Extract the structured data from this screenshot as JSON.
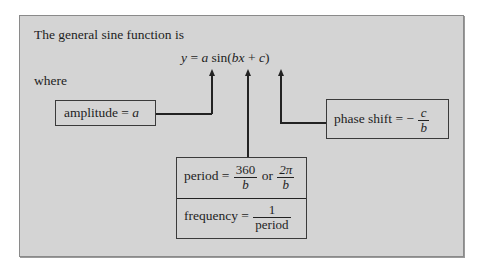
{
  "intro": "The general sine function is",
  "equation": {
    "y": "y",
    "eq": " = ",
    "a": "a",
    "sin": " sin(",
    "bx": "bx",
    "plus": " + ",
    "c": "c",
    "close": ")"
  },
  "where": "where",
  "amplitude": {
    "label": "amplitude = ",
    "var": "a"
  },
  "phase_shift": {
    "label": "phase shift = − ",
    "num": "c",
    "den": "b"
  },
  "period": {
    "label": "period = ",
    "num1": "360",
    "den1": "b",
    "or": " or ",
    "num2": "2π",
    "den2": "b"
  },
  "frequency": {
    "label": "frequency = ",
    "num": "1",
    "den": "period"
  }
}
